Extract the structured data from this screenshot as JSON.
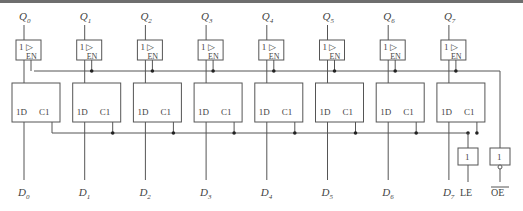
{
  "diagram": {
    "outputs": [
      {
        "name": "Q",
        "sub": "0"
      },
      {
        "name": "Q",
        "sub": "1"
      },
      {
        "name": "Q",
        "sub": "2"
      },
      {
        "name": "Q",
        "sub": "3"
      },
      {
        "name": "Q",
        "sub": "4"
      },
      {
        "name": "Q",
        "sub": "5"
      },
      {
        "name": "Q",
        "sub": "6"
      },
      {
        "name": "Q",
        "sub": "7"
      }
    ],
    "inputs": [
      {
        "name": "D",
        "sub": "0"
      },
      {
        "name": "D",
        "sub": "1"
      },
      {
        "name": "D",
        "sub": "2"
      },
      {
        "name": "D",
        "sub": "3"
      },
      {
        "name": "D",
        "sub": "4"
      },
      {
        "name": "D",
        "sub": "5"
      },
      {
        "name": "D",
        "sub": "6"
      },
      {
        "name": "D",
        "sub": "7"
      }
    ],
    "buffer": {
      "label_top": "1",
      "triangle": "▷",
      "label_en": "EN"
    },
    "latch": {
      "label_d": "1D",
      "label_c": "C1"
    },
    "le_gate": {
      "label": "1",
      "pin": "LE"
    },
    "oe_gate": {
      "label": "1",
      "pin": "OE",
      "inverted": true
    }
  }
}
